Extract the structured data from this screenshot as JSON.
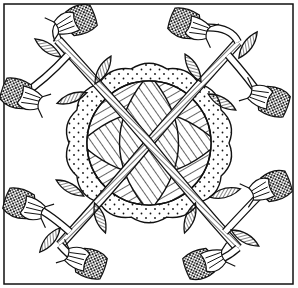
{
  "image": {
    "description": "Black and white line-art quilt block: central hatched circle with lens shapes, dotted scalloped ring, two crossing striped vines ending in eight flowers with leaves",
    "colors": {
      "ink": "#111111",
      "paper": "#ffffff"
    },
    "border": {
      "x": 4,
      "y": 4,
      "w": 289,
      "h": 280
    },
    "center": {
      "cx": 149,
      "cy": 143,
      "r": 62
    },
    "scallop_ring": {
      "cx": 149,
      "cy": 143,
      "r": 80
    },
    "flowers": [
      {
        "name": "flower-top-left-upper",
        "x": 75,
        "y": 22,
        "angle": -20
      },
      {
        "name": "flower-top-left-lower",
        "x": 22,
        "y": 95,
        "angle": 200
      },
      {
        "name": "flower-top-right-upper",
        "x": 190,
        "y": 25,
        "angle": 200
      },
      {
        "name": "flower-top-right-lower",
        "x": 268,
        "y": 100,
        "angle": 20
      },
      {
        "name": "flower-bottom-left-upper",
        "x": 25,
        "y": 205,
        "angle": 200
      },
      {
        "name": "flower-bottom-left-lower",
        "x": 85,
        "y": 262,
        "angle": 20
      },
      {
        "name": "flower-bottom-right-upper",
        "x": 270,
        "y": 188,
        "angle": -20
      },
      {
        "name": "flower-bottom-right-lower",
        "x": 205,
        "y": 262,
        "angle": 160
      }
    ],
    "leaves": [
      {
        "x": 48,
        "y": 48,
        "angle": 35
      },
      {
        "x": 103,
        "y": 70,
        "angle": -60
      },
      {
        "x": 72,
        "y": 98,
        "angle": -20
      },
      {
        "x": 193,
        "y": 68,
        "angle": 60
      },
      {
        "x": 248,
        "y": 45,
        "angle": -55
      },
      {
        "x": 222,
        "y": 102,
        "angle": 30
      },
      {
        "x": 70,
        "y": 188,
        "angle": 30
      },
      {
        "x": 100,
        "y": 218,
        "angle": 70
      },
      {
        "x": 50,
        "y": 240,
        "angle": -50
      },
      {
        "x": 225,
        "y": 193,
        "angle": -15
      },
      {
        "x": 190,
        "y": 218,
        "angle": -70
      },
      {
        "x": 245,
        "y": 238,
        "angle": 30
      }
    ]
  }
}
